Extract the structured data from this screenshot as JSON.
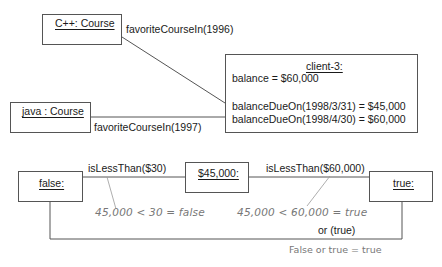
{
  "objects": {
    "cpp_course": {
      "name": "C++: Course"
    },
    "java_course": {
      "name": "java : Course"
    },
    "client": {
      "name": "client-3:",
      "attribute": "balance = $60,000",
      "queries": [
        "balanceDueOn(1998/3/31) = $45,000",
        "balanceDueOn(1998/4/30) = $60,000"
      ]
    },
    "false_obj": {
      "name": "false:"
    },
    "amount_obj": {
      "name": "$45,000:"
    },
    "true_obj": {
      "name": "true:"
    }
  },
  "links": {
    "cpp_link": "favoriteCourseIn(1996)",
    "java_link": "favoriteCourseIn(1997)",
    "less_than_30": "isLessThan($30)",
    "less_than_60000": "isLessThan($60,000)",
    "or_link": "or (true)"
  },
  "annotations": {
    "note_false": "45,000 < 30 = false",
    "note_true": "45,000 < 60,000 = true",
    "note_or": "False or true = true"
  }
}
